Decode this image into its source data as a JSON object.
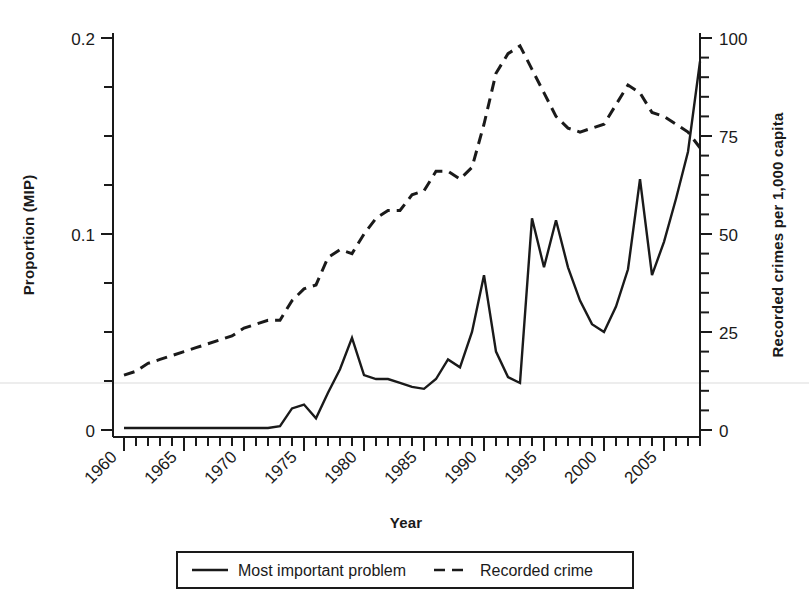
{
  "chart_data": {
    "type": "line",
    "title": "",
    "xlabel": "Year",
    "ylabel": "Proportion (MIP)",
    "y2label": "Recorded crimes per 1,000 capita",
    "xlim": [
      1960,
      2008
    ],
    "ylim": [
      0,
      0.2
    ],
    "y2lim": [
      0,
      100
    ],
    "xticks": [
      1960,
      1965,
      1970,
      1975,
      1980,
      1985,
      1990,
      1995,
      2000,
      2005
    ],
    "xticklabels": [
      "1960",
      "1965",
      "1970",
      "1975",
      "1980",
      "1985",
      "1990",
      "1995",
      "2000",
      "2005"
    ],
    "xminorticks": "every year",
    "yticks": [
      0,
      0.1,
      0.2
    ],
    "yticklabels": [
      "0",
      "0.1",
      "0.2"
    ],
    "yminorticks": [
      0.025,
      0.05,
      0.075,
      0.125,
      0.15,
      0.175
    ],
    "y2ticks": [
      0,
      25,
      50,
      75,
      100
    ],
    "y2ticklabels": [
      "0",
      "25",
      "50",
      "75",
      "100"
    ],
    "y2minorticks": "every 5 crimes",
    "grid": false,
    "legend_position": "bottom-center",
    "x": [
      1960,
      1961,
      1962,
      1963,
      1964,
      1965,
      1966,
      1967,
      1968,
      1969,
      1970,
      1971,
      1972,
      1973,
      1974,
      1975,
      1976,
      1977,
      1978,
      1979,
      1980,
      1981,
      1982,
      1983,
      1984,
      1985,
      1986,
      1987,
      1988,
      1989,
      1990,
      1991,
      1992,
      1993,
      1994,
      1995,
      1996,
      1997,
      1998,
      1999,
      2000,
      2001,
      2002,
      2003,
      2004,
      2005,
      2006,
      2007,
      2008
    ],
    "series": [
      {
        "name": "Most important problem",
        "axis": "left",
        "style": "solid",
        "color": "#1a1a1a",
        "values": [
          0.001,
          0.001,
          0.001,
          0.001,
          0.001,
          0.001,
          0.001,
          0.001,
          0.001,
          0.001,
          0.001,
          0.001,
          0.001,
          0.002,
          0.011,
          0.013,
          0.006,
          0.019,
          0.031,
          0.047,
          0.028,
          0.026,
          0.026,
          0.024,
          0.022,
          0.021,
          0.026,
          0.036,
          0.032,
          0.05,
          0.079,
          0.04,
          0.027,
          0.024,
          0.108,
          0.083,
          0.107,
          0.083,
          0.066,
          0.054,
          0.05,
          0.063,
          0.082,
          0.128,
          0.079,
          0.096,
          0.118,
          0.142,
          0.188
        ],
        "last_point_note": "line drops after 2008 peak"
      },
      {
        "name": "Recorded crime",
        "axis": "right",
        "style": "dashed",
        "color": "#1a1a1a",
        "values": [
          14,
          15,
          17,
          18,
          19,
          20,
          21,
          22,
          23,
          24,
          26,
          27,
          28,
          28,
          33,
          36,
          37,
          44,
          46,
          45,
          50,
          54,
          56,
          56,
          60,
          61,
          66,
          66,
          64,
          67,
          78,
          91,
          96,
          98,
          92,
          86,
          80,
          77,
          76,
          77,
          78,
          83,
          88,
          86,
          81,
          80,
          78,
          76,
          72
        ]
      }
    ],
    "legend": [
      {
        "label": "Most important problem",
        "style": "solid"
      },
      {
        "label": "Recorded crime",
        "style": "dashed"
      }
    ]
  },
  "axes": {
    "left_title": "Proportion (MIP)",
    "right_title": "Recorded crimes per 1,000 capita",
    "bottom_title": "Year",
    "left_ticks": [
      "0.2",
      "0.1",
      "0"
    ],
    "right_ticks": [
      "100",
      "75",
      "50",
      "25",
      "0"
    ],
    "x_ticks": [
      "1960",
      "1965",
      "1970",
      "1975",
      "1980",
      "1985",
      "1990",
      "1995",
      "2000",
      "2005"
    ]
  },
  "legend": {
    "items": [
      {
        "label": "Most important problem",
        "style": "solid"
      },
      {
        "label": "Recorded crime",
        "style": "dashed"
      }
    ]
  },
  "style": {
    "line_color": "#1a1a1a",
    "axis_color": "#1a1a1a",
    "background": "#ffffff",
    "faint_rule_color": "#ededed"
  }
}
